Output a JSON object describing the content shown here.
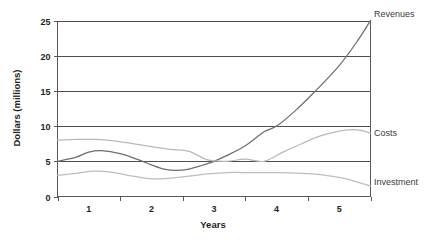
{
  "chart_data": {
    "type": "line",
    "title": "",
    "xlabel": "Years",
    "ylabel": "Dollars (millions)",
    "xlim": [
      0.5,
      5.5
    ],
    "ylim": [
      0,
      25
    ],
    "yticks": [
      "0",
      "5",
      "10",
      "15",
      "20",
      "25"
    ],
    "ytick_values": [
      0,
      5,
      10,
      15,
      20,
      25
    ],
    "xticks": [
      "1",
      "2",
      "3",
      "4",
      "5"
    ],
    "xtick_values": [
      1,
      2,
      3,
      4,
      5
    ],
    "grid": "horizontal",
    "legend_position": "right-inline-labels",
    "series": [
      {
        "name": "Revenues",
        "color": "#6e6e73",
        "label_text": "Revenues",
        "x": [
          0.5,
          0.8,
          1.0,
          1.2,
          1.5,
          1.8,
          2.0,
          2.2,
          2.4,
          2.6,
          2.8,
          3.0,
          3.2,
          3.5,
          3.8,
          4.0,
          4.3,
          4.6,
          5.0,
          5.3,
          5.5
        ],
        "values": [
          5.0,
          5.6,
          6.3,
          6.5,
          6.1,
          5.2,
          4.5,
          3.9,
          3.7,
          3.9,
          4.4,
          5.0,
          5.8,
          7.2,
          9.2,
          10.0,
          12.2,
          14.8,
          18.6,
          22.2,
          25.0
        ]
      },
      {
        "name": "Costs",
        "color": "#b9b9bc",
        "label_text": "Costs",
        "x": [
          0.5,
          0.8,
          1.1,
          1.4,
          1.7,
          2.0,
          2.3,
          2.6,
          2.9,
          3.2,
          3.5,
          3.8,
          4.1,
          4.4,
          4.7,
          5.0,
          5.2,
          5.35,
          5.5
        ],
        "values": [
          8.0,
          8.1,
          8.1,
          7.9,
          7.5,
          7.1,
          6.7,
          6.4,
          5.2,
          5.0,
          5.3,
          5.0,
          6.3,
          7.5,
          8.6,
          9.3,
          9.5,
          9.4,
          9.0
        ]
      },
      {
        "name": "Investment",
        "color": "#bdbdc0",
        "label_text": "Investment",
        "x": [
          0.5,
          0.8,
          1.1,
          1.4,
          1.7,
          2.0,
          2.3,
          2.6,
          2.9,
          3.2,
          3.6,
          4.0,
          4.4,
          4.7,
          5.0,
          5.2,
          5.5
        ],
        "values": [
          3.0,
          3.3,
          3.6,
          3.4,
          2.9,
          2.5,
          2.6,
          2.9,
          3.2,
          3.4,
          3.4,
          3.4,
          3.3,
          3.1,
          2.7,
          2.3,
          1.5
        ]
      }
    ],
    "annotations": [
      {
        "text": "Revenues",
        "x_px": 374,
        "y_px": 17
      },
      {
        "text": "Costs",
        "x_px": 374,
        "y_px": 136
      },
      {
        "text": "Investment",
        "x_px": 374,
        "y_px": 185
      }
    ]
  }
}
